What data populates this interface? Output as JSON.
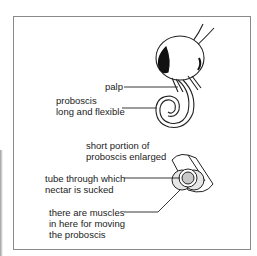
{
  "diagram": {
    "labels": {
      "palp": "palp",
      "proboscis_1": "proboscis",
      "proboscis_2": "long and flexible",
      "enlarged_1": "short portion of",
      "enlarged_2": "proboscis enlarged",
      "tube_1": "tube through which",
      "tube_2": "nectar is sucked",
      "muscles_1": "there are muscles",
      "muscles_2": "in here for moving",
      "muscles_3": "the proboscis"
    },
    "colors": {
      "line": "#222222",
      "frame": "#8a8a8a",
      "fill_light": "#e6e6e6",
      "fill_mid": "#c8c8c8"
    }
  }
}
